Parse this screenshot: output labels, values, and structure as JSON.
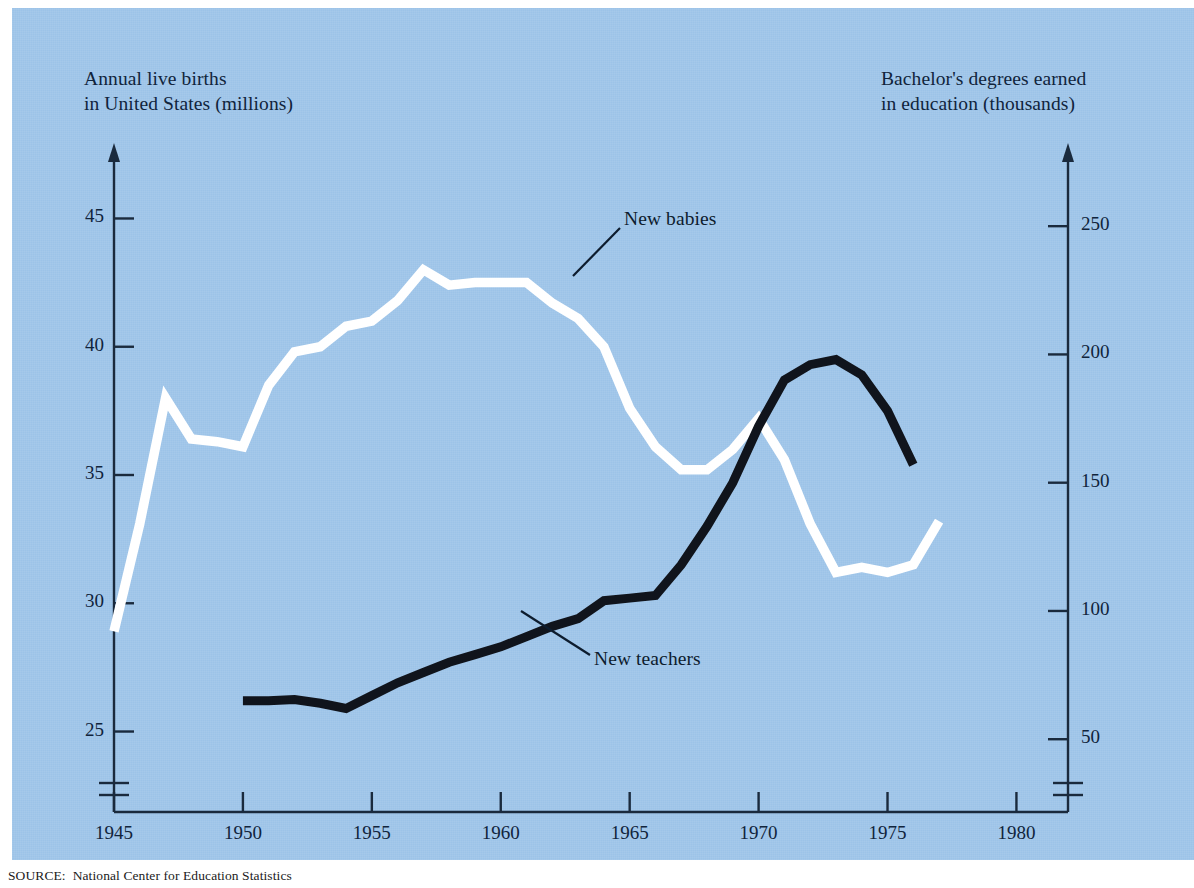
{
  "figure": {
    "background_color": "#ffffff",
    "plate_color": "#9cc3e8",
    "source_note": "SOURCE:  National Center for Education Statistics"
  },
  "chart_data": {
    "type": "line",
    "title": "",
    "subtitle": "",
    "xlabel": "",
    "ylabel": "Annual live births in United States (millions)",
    "y2label": "Bachelor's degrees earned in education (thousands)",
    "grid": false,
    "legend_position": "inline-annotations",
    "xlim": [
      1945,
      1982
    ],
    "xticks": [
      1945,
      1950,
      1955,
      1960,
      1965,
      1970,
      1975,
      1980
    ],
    "xtick_labels": [
      "1945",
      "1950",
      "1955",
      "1960",
      "1965",
      "1970",
      "1975",
      "1980"
    ],
    "ylim": [
      23.5,
      46.5
    ],
    "yticks": [
      25,
      30,
      35,
      40,
      45
    ],
    "ytick_labels": [
      "25",
      "30",
      "35",
      "40",
      "45"
    ],
    "y2lim": [
      38,
      268
    ],
    "y2ticks": [
      50,
      100,
      150,
      200,
      250
    ],
    "y2tick_labels": [
      "50",
      "100",
      "150",
      "200",
      "250"
    ],
    "axis_break": true,
    "series": [
      {
        "name": "New babies",
        "label": "New babies",
        "color": "#ffffff",
        "axis": "left",
        "units": "millions",
        "x": [
          1945,
          1946,
          1947,
          1948,
          1949,
          1950,
          1951,
          1952,
          1953,
          1954,
          1955,
          1956,
          1957,
          1958,
          1959,
          1960,
          1961,
          1962,
          1963,
          1964,
          1965,
          1966,
          1967,
          1968,
          1969,
          1970,
          1971,
          1972,
          1973,
          1974,
          1975,
          1976,
          1977
        ],
        "values": [
          28.9,
          33.1,
          38.0,
          36.4,
          36.3,
          36.1,
          38.5,
          39.8,
          40.0,
          40.8,
          41.0,
          41.8,
          43.0,
          42.4,
          42.5,
          42.5,
          42.5,
          41.7,
          41.1,
          40.0,
          37.6,
          36.1,
          35.2,
          35.2,
          36.0,
          37.2,
          35.6,
          33.1,
          31.2,
          31.4,
          31.2,
          31.5,
          33.2
        ]
      },
      {
        "name": "New teachers",
        "label": "New teachers",
        "color": "#10141c",
        "axis": "right",
        "units": "thousands",
        "x": [
          1950,
          1951,
          1952,
          1953,
          1954,
          1955,
          1956,
          1957,
          1958,
          1959,
          1960,
          1961,
          1962,
          1963,
          1964,
          1965,
          1966,
          1967,
          1968,
          1969,
          1970,
          1971,
          1972,
          1973,
          1974,
          1975,
          1976
        ],
        "values": [
          65,
          65,
          65.5,
          64,
          62,
          67,
          72,
          76,
          80,
          83,
          86,
          90,
          94,
          97,
          104,
          105,
          106,
          118,
          133,
          150,
          172,
          190,
          196,
          198,
          192,
          178,
          157
        ]
      }
    ],
    "annotations": [
      {
        "text": "New babies",
        "text_x": 624,
        "text_y": 208,
        "leader_from_x": 620,
        "leader_from_y": 228,
        "leader_to_x": 573,
        "leader_to_y": 276
      },
      {
        "text": "New teachers",
        "text_x": 594,
        "text_y": 648,
        "leader_from_x": 590,
        "leader_from_y": 655,
        "leader_to_x": 521,
        "leader_to_y": 611
      }
    ]
  },
  "axis_titles": {
    "left": "Annual live births\nin United States (millions)",
    "right": "Bachelor's degrees earned\nin education (thousands)"
  }
}
